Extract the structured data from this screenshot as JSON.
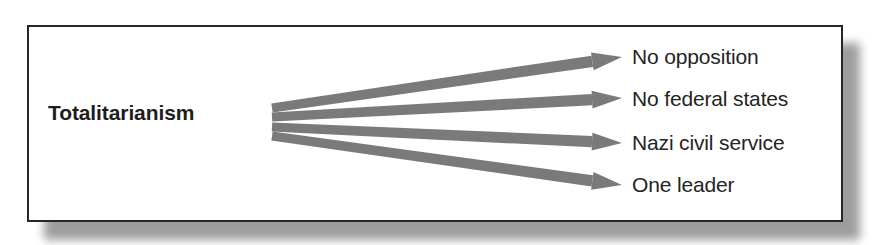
{
  "figure": {
    "kind": "concept-fan-diagram",
    "source_node": {
      "label": "Totalitarianism"
    },
    "outcomes": [
      {
        "label": "No opposition"
      },
      {
        "label": "No federal states"
      },
      {
        "label": "Nazi civil service"
      },
      {
        "label": "One leader"
      }
    ],
    "colors": {
      "page_background": "#ffffff",
      "frame_border": "#262626",
      "frame_fill": "#ffffff",
      "arrow_gray": "#7a7a7a",
      "source_text": "#1d1d1d",
      "outcome_text": "#242424",
      "shadow_gray": "#8d8d8d"
    },
    "arrows": [
      {
        "name": "arrow-to-no-opposition",
        "x1": 272,
        "y1": 108,
        "x2": 622,
        "y2": 57,
        "tail_half": 4.5,
        "head_half": 9
      },
      {
        "name": "arrow-to-no-federal-states",
        "x1": 272,
        "y1": 117,
        "x2": 622,
        "y2": 98,
        "tail_half": 4.5,
        "head_half": 9
      },
      {
        "name": "arrow-to-nazi-civil-service",
        "x1": 272,
        "y1": 127,
        "x2": 622,
        "y2": 143,
        "tail_half": 4.5,
        "head_half": 9
      },
      {
        "name": "arrow-to-one-leader",
        "x1": 272,
        "y1": 136,
        "x2": 622,
        "y2": 185,
        "tail_half": 4.5,
        "head_half": 9
      }
    ]
  }
}
